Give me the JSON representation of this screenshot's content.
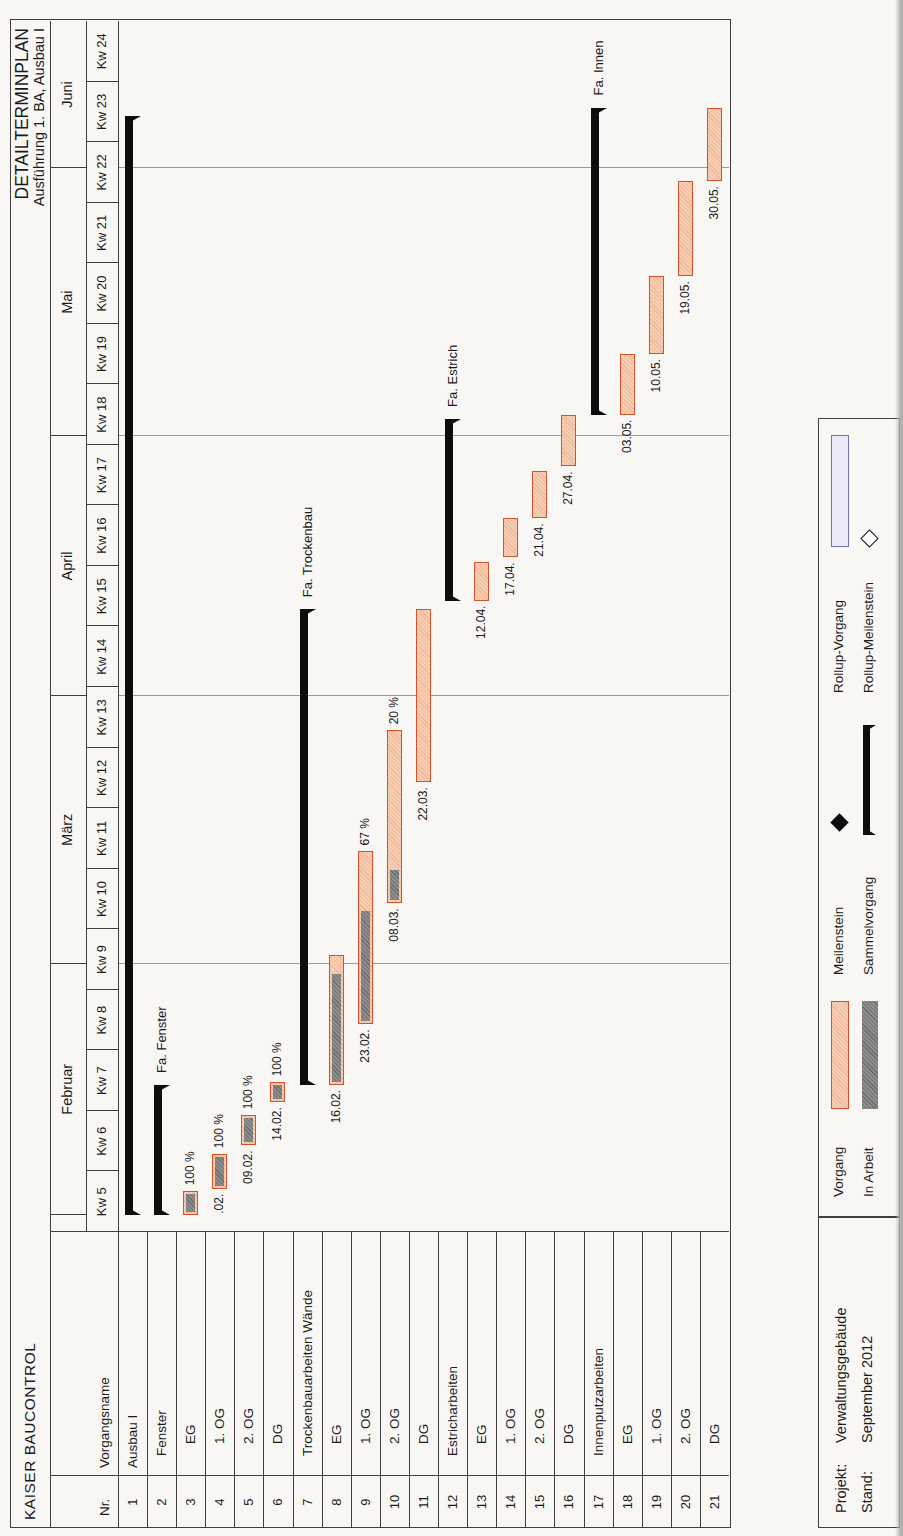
{
  "header": {
    "company": "KAISER BAUCONTROL",
    "title": "DETAILTERMINPLAN",
    "subtitle": "Ausführung 1. BA, Ausbau I"
  },
  "table": {
    "nr_header": "Nr.",
    "name_header": "Vorgangsname"
  },
  "timeline": {
    "months": [
      {
        "label": "",
        "start_day": 0,
        "end_day": 2
      },
      {
        "label": "Februar",
        "start_day": 2,
        "end_day": 31
      },
      {
        "label": "März",
        "start_day": 31,
        "end_day": 62
      },
      {
        "label": "April",
        "start_day": 62,
        "end_day": 92
      },
      {
        "label": "Mai",
        "start_day": 92,
        "end_day": 123
      },
      {
        "label": "Juni",
        "start_day": 123,
        "end_day": 140
      }
    ],
    "weeks": [
      "Kw 5",
      "Kw 6",
      "Kw 7",
      "Kw 8",
      "Kw 9",
      "Kw 10",
      "Kw 11",
      "Kw 12",
      "Kw 13",
      "Kw 14",
      "Kw 15",
      "Kw 16",
      "Kw 17",
      "Kw 18",
      "Kw 19",
      "Kw 20",
      "Kw 21",
      "Kw 22",
      "Kw 23",
      "Kw 24"
    ],
    "days_total": 140,
    "month_gridline_days": [
      31,
      62,
      92,
      123
    ]
  },
  "chart_data": {
    "type": "gantt",
    "time_unit": "days from start of Kw 5",
    "tasks": [
      {
        "nr": 1,
        "name": "Ausbau I",
        "indent": 0,
        "kind": "summary",
        "start": 2,
        "end": 129
      },
      {
        "nr": 2,
        "name": "Fenster",
        "indent": 1,
        "kind": "summary",
        "start": 2,
        "end": 17,
        "end_label": "Fa. Fenster"
      },
      {
        "nr": 3,
        "name": "EG",
        "indent": 2,
        "kind": "task",
        "start": 2,
        "end": 4.7,
        "progress_pct": 100,
        "pct_label": "100 %"
      },
      {
        "nr": 4,
        "name": "1. OG",
        "indent": 2,
        "kind": "task",
        "start": 5,
        "end": 9,
        "progress_pct": 100,
        "pct_label": "100 %",
        "date_label": ".02."
      },
      {
        "nr": 5,
        "name": "2. OG",
        "indent": 2,
        "kind": "task",
        "start": 10,
        "end": 13.5,
        "progress_pct": 100,
        "pct_label": "100 %",
        "date_label": "09.02."
      },
      {
        "nr": 6,
        "name": "DG",
        "indent": 2,
        "kind": "task",
        "start": 15,
        "end": 17.3,
        "progress_pct": 100,
        "pct_label": "100 %",
        "date_label": "14.02."
      },
      {
        "nr": 7,
        "name": "Trockenbauarbeiten Wände",
        "indent": 1,
        "kind": "summary",
        "start": 17,
        "end": 72,
        "end_label": "Fa. Trockenbau"
      },
      {
        "nr": 8,
        "name": "EG",
        "indent": 2,
        "kind": "task",
        "start": 17,
        "end": 32,
        "progress_pct": 88,
        "date_label": "16.02."
      },
      {
        "nr": 9,
        "name": "1. OG",
        "indent": 2,
        "kind": "task",
        "start": 24,
        "end": 44,
        "progress_pct": 67,
        "pct_label": "67 %",
        "date_label": "23.02."
      },
      {
        "nr": 10,
        "name": "2. OG",
        "indent": 2,
        "kind": "task",
        "start": 38,
        "end": 58,
        "progress_pct": 20,
        "pct_label": "20 %",
        "date_label": "08.03."
      },
      {
        "nr": 11,
        "name": "DG",
        "indent": 2,
        "kind": "task",
        "start": 52,
        "end": 72,
        "progress_pct": 0,
        "date_label": "22.03."
      },
      {
        "nr": 12,
        "name": "Estricharbeiten",
        "indent": 1,
        "kind": "summary",
        "start": 73,
        "end": 94,
        "end_label": "Fa. Estrich"
      },
      {
        "nr": 13,
        "name": "EG",
        "indent": 2,
        "kind": "task",
        "start": 73,
        "end": 77.5,
        "progress_pct": 0,
        "date_label": "12.04."
      },
      {
        "nr": 14,
        "name": "1. OG",
        "indent": 2,
        "kind": "task",
        "start": 78,
        "end": 82.5,
        "progress_pct": 0,
        "date_label": "17.04."
      },
      {
        "nr": 15,
        "name": "2. OG",
        "indent": 2,
        "kind": "task",
        "start": 82.5,
        "end": 88,
        "progress_pct": 0,
        "date_label": "21.04."
      },
      {
        "nr": 16,
        "name": "DG",
        "indent": 2,
        "kind": "task",
        "start": 88.5,
        "end": 94.5,
        "progress_pct": 0,
        "date_label": "27.04."
      },
      {
        "nr": 17,
        "name": "Innenputzarbeiten",
        "indent": 1,
        "kind": "summary",
        "start": 94.5,
        "end": 130,
        "end_label": "Fa. Innen"
      },
      {
        "nr": 18,
        "name": "EG",
        "indent": 2,
        "kind": "task",
        "start": 94.5,
        "end": 101.5,
        "progress_pct": 0,
        "date_label": "03.05."
      },
      {
        "nr": 19,
        "name": "1. OG",
        "indent": 2,
        "kind": "task",
        "start": 101.5,
        "end": 110.5,
        "progress_pct": 0,
        "date_label": "10.05."
      },
      {
        "nr": 20,
        "name": "2. OG",
        "indent": 2,
        "kind": "task",
        "start": 110.5,
        "end": 121.5,
        "progress_pct": 0,
        "date_label": "19.05."
      },
      {
        "nr": 21,
        "name": "DG",
        "indent": 2,
        "kind": "task",
        "start": 121.5,
        "end": 130,
        "progress_pct": 0,
        "date_label": "30.05."
      }
    ]
  },
  "legend": {
    "columns": [
      {
        "items": [
          {
            "label": "Vorgang",
            "symbol": "task-bar"
          },
          {
            "label": "In Arbeit",
            "symbol": "progress-bar"
          }
        ]
      },
      {
        "items": [
          {
            "label": "Meilenstein",
            "symbol": "milestone-diamond"
          },
          {
            "label": "Sammelvorgang",
            "symbol": "summary-bar"
          }
        ]
      },
      {
        "items": [
          {
            "label": "Rollup-Vorgang",
            "symbol": "rollup-bar"
          },
          {
            "label": "Rollup-Meilenstein",
            "symbol": "rollup-diamond"
          }
        ]
      }
    ]
  },
  "footer": {
    "project_label": "Projekt:",
    "project_value": "Verwaltungsgebäude",
    "date_label": "Stand:",
    "date_value": "September 2012"
  },
  "colors": {
    "task_border": "#d9512c",
    "task_fill": "#f6ceb3",
    "progress_fill": "#8d8d8d",
    "summary_black": "#0d0d0d",
    "rollup_fill": "#eaeaf6",
    "rollup_border": "#7272ab",
    "gridline": "#9a9a9a",
    "line": "#3f3f3f"
  }
}
